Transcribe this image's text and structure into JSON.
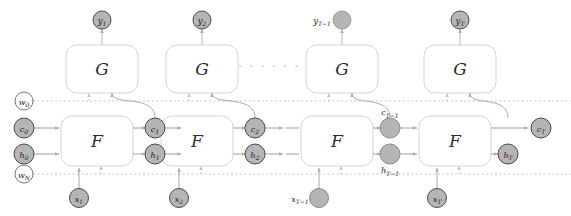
{
  "figure": {
    "type": "unrolled-recurrent-network-diagram",
    "background": "#ffffff",
    "colors": {
      "block_stroke": "#d0d0d0",
      "block_fill": "#ffffff",
      "node_fill_gray": "#b5b5b5",
      "node_fill_white": "#ffffff",
      "node_stroke": "#4a4a4a",
      "edge_solid": "#9a9a9a",
      "edge_dotted": "#b9b9b9",
      "text": "#1c1c1c",
      "ellipsis": "#c9c9c9"
    },
    "blocks": {
      "generator_label": "G",
      "recurrent_label": "F",
      "generator_count": 4,
      "recurrent_count": 4
    },
    "outputs": [
      {
        "name": "y1",
        "label": "y",
        "sub": "1",
        "label_position": "inside",
        "fill": "gray"
      },
      {
        "name": "y2",
        "label": "y",
        "sub": "2",
        "label_position": "inside",
        "fill": "gray"
      },
      {
        "name": "yT-1",
        "label": "y",
        "sub": "T−1",
        "label_position": "left",
        "fill": "gray"
      },
      {
        "name": "yT",
        "label": "y",
        "sub": "T",
        "label_position": "inside",
        "fill": "gray"
      }
    ],
    "inputs": [
      {
        "name": "x1",
        "label": "x",
        "sub": "1",
        "label_position": "inside",
        "fill": "gray"
      },
      {
        "name": "x2",
        "label": "x",
        "sub": "2",
        "label_position": "inside",
        "fill": "gray"
      },
      {
        "name": "xT-1",
        "label": "x",
        "sub": "T−1",
        "label_position": "left",
        "fill": "gray"
      },
      {
        "name": "xT",
        "label": "x",
        "sub": "T",
        "label_position": "inside",
        "fill": "gray"
      }
    ],
    "cell_states": [
      {
        "name": "c0",
        "label": "c",
        "sub": "0",
        "label_position": "inside",
        "fill": "gray"
      },
      {
        "name": "c1",
        "label": "c",
        "sub": "1",
        "label_position": "inside",
        "fill": "gray"
      },
      {
        "name": "c2",
        "label": "c",
        "sub": "2",
        "label_position": "inside",
        "fill": "gray"
      },
      {
        "name": "cT-1",
        "label": "c",
        "sub": "T−1",
        "label_position": "above",
        "fill": "gray"
      },
      {
        "name": "cT",
        "label": "c",
        "sub": "T",
        "label_position": "inside",
        "fill": "gray"
      }
    ],
    "hidden_states": [
      {
        "name": "h0",
        "label": "h",
        "sub": "0",
        "label_position": "inside",
        "fill": "gray"
      },
      {
        "name": "h1",
        "label": "h",
        "sub": "1",
        "label_position": "inside",
        "fill": "gray"
      },
      {
        "name": "h2",
        "label": "h",
        "sub": "2",
        "label_position": "inside",
        "fill": "gray"
      },
      {
        "name": "hT-1",
        "label": "h",
        "sub": "T−1",
        "label_position": "below",
        "fill": "gray"
      },
      {
        "name": "hT",
        "label": "h",
        "sub": "T",
        "label_position": "inside",
        "fill": "gray"
      }
    ],
    "weights": [
      {
        "name": "w0",
        "label": "w",
        "sub": "0",
        "label_position": "inside",
        "fill": "white"
      },
      {
        "name": "wN",
        "label": "w",
        "sub": "N",
        "label_position": "inside",
        "fill": "white"
      }
    ],
    "ellipsis_text": "· · · · · ·"
  }
}
